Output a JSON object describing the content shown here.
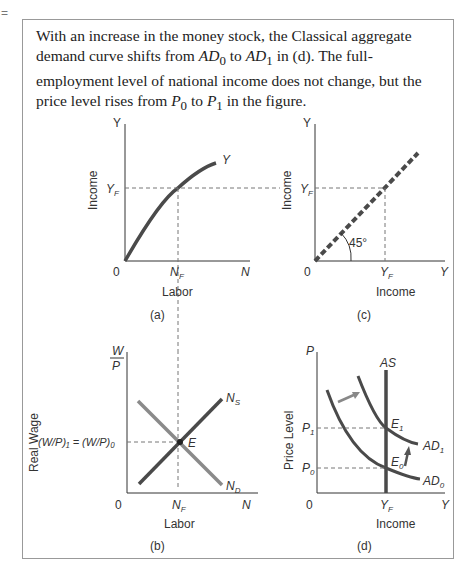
{
  "marker": "=",
  "caption": {
    "p1": "With an increase in the money stock, the Classical aggregate demand curve shifts from ",
    "ad0": "AD",
    "ad0_sub": "0",
    "p2": " to ",
    "ad1": "AD",
    "ad1_sub": "1",
    "p3": " in (d). The full-employment level of national income does not change, but the price level rises from ",
    "p0": "P",
    "p0_sub": "0",
    "p4": " to ",
    "p1v": "P",
    "p1_sub": "1",
    "p5": " in the figure."
  },
  "panels": {
    "a": {
      "label": "(a)",
      "y_axis": "Income",
      "x_axis": "Labor",
      "y_top": "Y",
      "x_end": "N",
      "origin": "0",
      "curve": "Y",
      "y_tick": "Y",
      "y_tick_sub": "F",
      "x_tick": "N",
      "x_tick_sub": "F"
    },
    "b": {
      "label": "(b)",
      "y_axis": "Real Wage",
      "x_axis": "Labor",
      "y_top_num": "W",
      "y_top_den": "P",
      "x_end": "N",
      "origin": "0",
      "supply": "N",
      "supply_sub": "S",
      "demand": "N",
      "demand_sub": "D",
      "eq_point": "E",
      "x_tick": "N",
      "x_tick_sub": "F",
      "wage_label": "(W/P)₁ = (W/P)₀"
    },
    "c": {
      "label": "(c)",
      "y_axis": "Income",
      "x_axis": "Income",
      "y_top": "Y",
      "x_end": "Y",
      "origin": "0",
      "angle": "45°",
      "y_tick": "Y",
      "y_tick_sub": "F",
      "x_tick": "Y",
      "x_tick_sub": "F"
    },
    "d": {
      "label": "(d)",
      "y_axis": "Price Level",
      "x_axis": "Income",
      "y_top": "P",
      "x_end": "Y",
      "origin": "0",
      "as": "AS",
      "ad1": "AD",
      "ad1_sub": "1",
      "ad0": "AD",
      "ad0_sub": "0",
      "e1": "E",
      "e1_sub": "1",
      "e0": "E",
      "e0_sub": "0",
      "p1": "P",
      "p1_sub": "1",
      "p0": "P",
      "p0_sub": "0",
      "x_tick": "Y",
      "x_tick_sub": "F"
    }
  },
  "colors": {
    "curve": "#4a4a4a",
    "light_curve": "#8a8a8a",
    "axis": "#333333",
    "dashed": "#777777"
  }
}
